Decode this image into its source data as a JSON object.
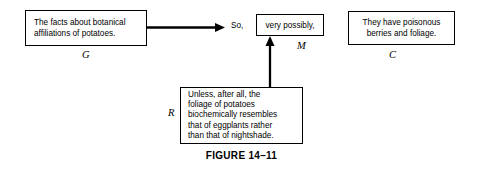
{
  "figure": {
    "caption": "FIGURE 14–11"
  },
  "boxes": {
    "g": {
      "id": "G",
      "role": "data",
      "lines": [
        "The facts about botanical",
        "affiliations of potatoes."
      ],
      "label": "G"
    },
    "m": {
      "id": "M",
      "role": "qualifier",
      "lines": [
        "very possibly,"
      ],
      "label": "M"
    },
    "c": {
      "id": "C",
      "role": "claim",
      "lines": [
        "They have poisonous",
        "berries and foliage."
      ],
      "label": "C"
    },
    "r": {
      "id": "R",
      "role": "rebuttal",
      "lines": [
        "Unless, after all, the",
        "foliage of potatoes",
        "biochemically resembles",
        "that of eggplants rather",
        "than that of nightshade."
      ],
      "label": "R"
    }
  },
  "connectors": {
    "so": "So,"
  },
  "colors": {
    "background": "#ffffff",
    "ink": "#000000",
    "border": "#000000"
  }
}
